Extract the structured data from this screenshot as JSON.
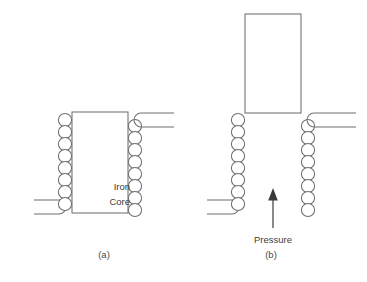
{
  "figure": {
    "background_color": "#ffffff",
    "line_color": "#6f6f6f",
    "text_color": "#404040",
    "arrow_color": "#3a3a3a",
    "width": 367,
    "height": 282
  },
  "panels": [
    {
      "id": "a",
      "caption": "(a)",
      "caption_x": 104,
      "caption_y": 258,
      "core": {
        "label_line1": "Iron",
        "label_line2": "Core",
        "label_x": 130,
        "label_y1": 190,
        "label_y2": 205,
        "x": 72,
        "y": 112,
        "width": 56,
        "height": 101,
        "raised": false
      },
      "left_coil": {
        "turns": 8,
        "cx": 65,
        "cy_start": 120,
        "spacing": 12.4,
        "radius": 6.6,
        "lead_side": "left",
        "lead_position": "bottom"
      },
      "right_coil": {
        "turns": 8,
        "cx": 135,
        "cy_start": 126,
        "spacing": 12.4,
        "radius": 6.6,
        "lead_side": "right",
        "lead_position": "top"
      }
    },
    {
      "id": "b",
      "caption": "(b)",
      "caption_x": 271,
      "caption_y": 258,
      "core": {
        "label_line1": "",
        "label_line2": "",
        "x": 245,
        "y": 14,
        "width": 56,
        "height": 99,
        "raised": true
      },
      "left_coil": {
        "turns": 8,
        "cx": 238,
        "cy_start": 120,
        "spacing": 12.4,
        "radius": 6.6,
        "lead_side": "left",
        "lead_position": "bottom"
      },
      "right_coil": {
        "turns": 8,
        "cx": 308,
        "cy_start": 126,
        "spacing": 12.4,
        "radius": 6.6,
        "lead_side": "right",
        "lead_position": "top"
      }
    }
  ],
  "annotations": {
    "pressure": {
      "label": "Pressure",
      "label_x": 273,
      "label_y": 243,
      "arrow_from_x": 273,
      "arrow_from_y": 228,
      "arrow_to_x": 273,
      "arrow_to_y": 190,
      "direction": "up"
    }
  }
}
